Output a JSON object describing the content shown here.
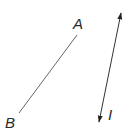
{
  "diagram": {
    "segment": {
      "label_start": "A",
      "label_end": "B",
      "start": [
        77,
        35
      ],
      "end": [
        19,
        113
      ],
      "color": "#555555"
    },
    "current": {
      "label": "I",
      "top": [
        122,
        9
      ],
      "bottom": [
        98,
        126
      ],
      "color": "#222222",
      "arrows": "both"
    }
  }
}
